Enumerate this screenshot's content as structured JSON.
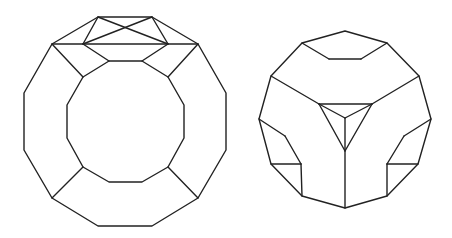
{
  "figures": [
    {
      "name": "truncated-solid-top-view",
      "outline": [
        [
          98,
          17
        ],
        [
          152,
          17
        ],
        [
          198,
          44
        ],
        [
          226,
          93
        ],
        [
          226,
          150
        ],
        [
          198,
          198
        ],
        [
          152,
          226
        ],
        [
          98,
          226
        ],
        [
          52,
          198
        ],
        [
          24,
          150
        ],
        [
          24,
          93
        ],
        [
          52,
          44
        ]
      ],
      "inner_polygon": [
        [
          109,
          61
        ],
        [
          142,
          61
        ],
        [
          168,
          77
        ],
        [
          184,
          105
        ],
        [
          184,
          138
        ],
        [
          168,
          167
        ],
        [
          142,
          182
        ],
        [
          109,
          182
        ],
        [
          83,
          167
        ],
        [
          67,
          138
        ],
        [
          67,
          105
        ],
        [
          83,
          77
        ]
      ],
      "segments": [
        [
          [
            98,
            17
          ],
          [
            168,
            44
          ]
        ],
        [
          [
            152,
            17
          ],
          [
            83,
            44
          ]
        ],
        [
          [
            98,
            17
          ],
          [
            83,
            44
          ]
        ],
        [
          [
            152,
            17
          ],
          [
            168,
            44
          ]
        ],
        [
          [
            52,
            44
          ],
          [
            198,
            44
          ]
        ],
        [
          [
            83,
            44
          ],
          [
            109,
            61
          ]
        ],
        [
          [
            168,
            44
          ],
          [
            142,
            61
          ]
        ],
        [
          [
            52,
            44
          ],
          [
            83,
            77
          ]
        ],
        [
          [
            198,
            44
          ],
          [
            168,
            77
          ]
        ],
        [
          [
            52,
            198
          ],
          [
            83,
            167
          ]
        ],
        [
          [
            198,
            198
          ],
          [
            168,
            167
          ]
        ]
      ]
    },
    {
      "name": "truncated-cube-corner-view",
      "outline": [
        [
          345,
          31
        ],
        [
          387,
          43
        ],
        [
          419,
          76
        ],
        [
          431,
          119
        ],
        [
          418,
          164
        ],
        [
          387,
          196
        ],
        [
          345,
          208
        ],
        [
          302,
          196
        ],
        [
          271,
          164
        ],
        [
          259,
          119
        ],
        [
          271,
          76
        ],
        [
          302,
          43
        ]
      ],
      "segments": [
        [
          [
            302,
            43
          ],
          [
            329,
            59
          ]
        ],
        [
          [
            329,
            59
          ],
          [
            361,
            59
          ]
        ],
        [
          [
            361,
            59
          ],
          [
            387,
            43
          ]
        ],
        [
          [
            271,
            76
          ],
          [
            319,
            104
          ]
        ],
        [
          [
            419,
            76
          ],
          [
            372,
            104
          ]
        ],
        [
          [
            319,
            104
          ],
          [
            372,
            104
          ]
        ],
        [
          [
            372,
            104
          ],
          [
            345,
            151
          ]
        ],
        [
          [
            345,
            151
          ],
          [
            319,
            104
          ]
        ],
        [
          [
            319,
            104
          ],
          [
            345,
            118
          ]
        ],
        [
          [
            372,
            104
          ],
          [
            345,
            118
          ]
        ],
        [
          [
            345,
            118
          ],
          [
            345,
            208
          ]
        ],
        [
          [
            259,
            119
          ],
          [
            285,
            136
          ]
        ],
        [
          [
            285,
            136
          ],
          [
            301,
            164
          ]
        ],
        [
          [
            301,
            164
          ],
          [
            271,
            164
          ]
        ],
        [
          [
            301,
            164
          ],
          [
            302,
            196
          ]
        ],
        [
          [
            431,
            119
          ],
          [
            404,
            136
          ]
        ],
        [
          [
            404,
            136
          ],
          [
            387,
            164
          ]
        ],
        [
          [
            387,
            164
          ],
          [
            418,
            164
          ]
        ],
        [
          [
            387,
            164
          ],
          [
            387,
            196
          ]
        ]
      ]
    }
  ]
}
